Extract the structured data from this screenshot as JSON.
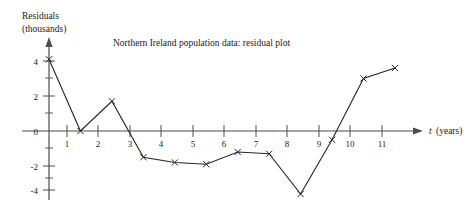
{
  "chart_data": {
    "type": "line",
    "title": "Northern Ireland population data: residual plot",
    "xlabel": "t (years)",
    "xlabel_symbol": "t",
    "xlabel_unit": "(years)",
    "ylabel": "Residuals (thousands)",
    "ylabel_line1": "Residuals",
    "ylabel_line2": "(thousands)",
    "x": [
      0,
      1,
      2,
      3,
      4,
      5,
      6,
      7,
      8,
      9,
      10,
      11
    ],
    "values": [
      4.1,
      0.0,
      1.7,
      -1.5,
      -1.8,
      -1.9,
      -1.2,
      -1.3,
      -3.6,
      -0.5,
      3.0,
      3.6
    ],
    "xlim": [
      0,
      12.2
    ],
    "ylim": [
      -4.6,
      4.7
    ],
    "xticks": [
      1,
      2,
      3,
      4,
      5,
      6,
      7,
      8,
      9,
      10,
      11
    ],
    "xtick_labels": [
      "1",
      "2",
      "3",
      "4",
      "5",
      "6",
      "7",
      "8",
      "9",
      "10",
      "11"
    ],
    "yticks": [
      -4,
      -2,
      0,
      2,
      4
    ],
    "ytick_labels": [
      "-4",
      "-2",
      "0",
      "2",
      "4"
    ],
    "yticks_minor": [
      -3,
      -1,
      1,
      3
    ],
    "grid": false,
    "legend": null,
    "marker": "x",
    "line_color": "#262626",
    "axis_color": "#4d4d4d"
  }
}
